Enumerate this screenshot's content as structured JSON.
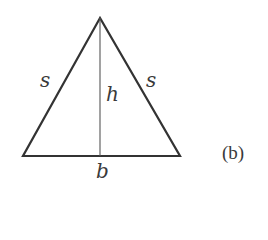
{
  "figure": {
    "caption": "(b)",
    "shape": "isosceles-triangle",
    "labels": {
      "left_side": "s",
      "right_side": "s",
      "height": "h",
      "base": "b"
    },
    "stroke_color": "#333333",
    "text_color": "#3a3a3a"
  }
}
